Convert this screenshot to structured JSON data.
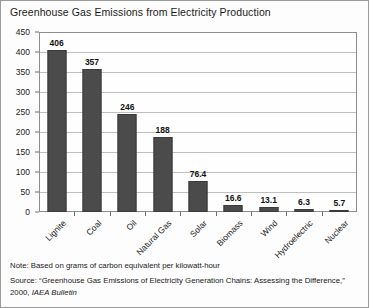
{
  "chart_data": {
    "type": "bar",
    "title": "Greenhouse Gas Emissions from Electricity Production",
    "categories": [
      "Lignite",
      "Coal",
      "Oil",
      "Natural Gas",
      "Solar",
      "Biomass",
      "Wind",
      "Hydroelectric",
      "Nuclear"
    ],
    "categories_full": [
      "Lignite",
      "Coal",
      "Oil",
      "Natural Gas",
      "Solar",
      "Biomass",
      "Wind",
      "Hydroelectric",
      "Nuclear"
    ],
    "values": [
      406,
      357,
      246,
      188,
      76.4,
      16.6,
      13.1,
      6.3,
      5.7
    ],
    "value_labels": [
      "406",
      "357",
      "246",
      "188",
      "76.4",
      "16.6",
      "13.1",
      "6.3",
      "5.7"
    ],
    "xlabel": "",
    "ylabel": "",
    "ylim": [
      0,
      450
    ],
    "yticks": [
      0,
      50,
      100,
      150,
      200,
      250,
      300,
      350,
      400,
      450
    ],
    "ytick_labels": [
      "0",
      "50",
      "100",
      "150",
      "200",
      "250",
      "300",
      "350",
      "400",
      "450"
    ],
    "grid": "horizontal",
    "legend": "none",
    "bar_color": "#4b4b4b",
    "gridline_color": "#bfbfbf",
    "units": "grams of carbon equivalent per kilowatt-hour"
  },
  "footnotes": {
    "note": "Note: Based on grams of carbon equivalent per kilowatt-hour",
    "source_prefix": "Source: “Greenhouse Gas Emissions of Electricity Generation Chains: Assessing the Difference,”",
    "source_year": "2000, ",
    "source_publication": "IAEA Bulletin"
  }
}
